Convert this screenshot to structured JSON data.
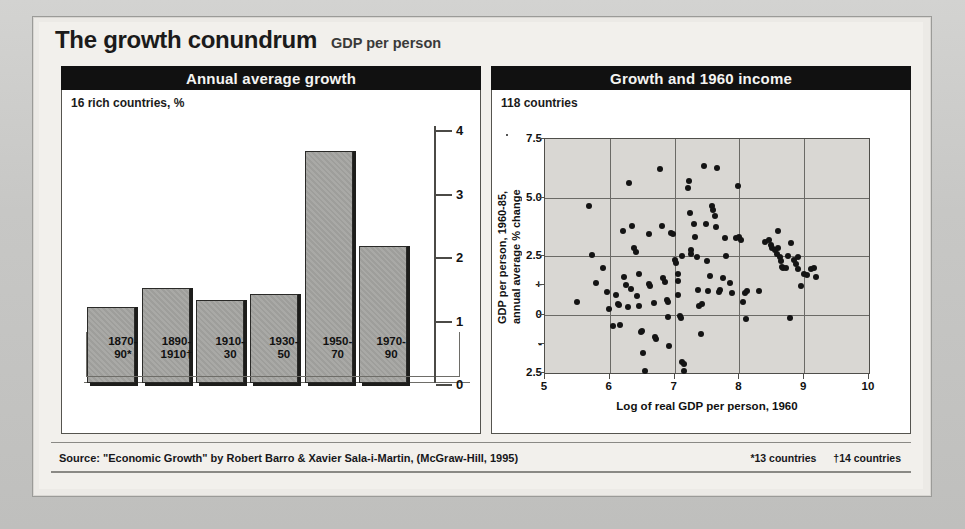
{
  "header": {
    "title": "The growth conundrum",
    "subtitle": "GDP per person"
  },
  "panels": {
    "left": {
      "heading": "Annual average growth",
      "note": "16 rich countries, %"
    },
    "right": {
      "heading": "Growth and 1960 income",
      "note": "118 countries"
    }
  },
  "footer": {
    "source": "Source: \"Economic Growth\" by Robert Barro & Xavier Sala-i-Martin, (McGraw-Hill, 1995)",
    "note_star": "*13 countries",
    "note_dagger": "†14 countries"
  },
  "chart_data": [
    {
      "type": "bar",
      "title": "Annual average growth",
      "subtitle": "16 rich countries, %",
      "xlabel": "",
      "ylabel": "%",
      "ylim": [
        0,
        4
      ],
      "yticks": [
        0,
        1,
        2,
        3,
        4
      ],
      "ytick_labels": [
        "0",
        "1",
        "2",
        "3",
        "4"
      ],
      "grid": false,
      "axis_position": "right",
      "categories": [
        "1870-\n90*",
        "1890-\n1910†",
        "1910-\n30",
        "1930-\n50",
        "1950-\n70",
        "1970-\n90"
      ],
      "category_labels": [
        [
          "1870-",
          "90*"
        ],
        [
          "1890-",
          "1910†"
        ],
        [
          "1910-",
          "30"
        ],
        [
          "1930-",
          "50"
        ],
        [
          "1950-",
          "70"
        ],
        [
          "1970-",
          "90"
        ]
      ],
      "values": [
        1.2,
        1.5,
        1.3,
        1.4,
        3.65,
        2.15
      ]
    },
    {
      "type": "scatter",
      "title": "Growth and 1960 income",
      "subtitle": "118 countries",
      "xlabel": "Log of real GDP per person, 1960",
      "ylabel": "GDP per person, 1960-85,\nannual average % change",
      "xlim": [
        5,
        10
      ],
      "ylim": [
        -2.5,
        7.5
      ],
      "xticks": [
        5,
        6,
        7,
        8,
        9,
        10
      ],
      "xtick_labels": [
        "5",
        "6",
        "7",
        "8",
        "9",
        "10"
      ],
      "yticks": [
        7.5,
        5.0,
        2.5,
        1.25,
        0,
        -1.25,
        -2.5
      ],
      "ytick_labels": [
        "7.5",
        "5.0",
        "2.5",
        "+",
        "0",
        "-",
        "2.5"
      ],
      "grid": true,
      "points": [
        [
          5.5,
          0.55
        ],
        [
          5.68,
          4.62
        ],
        [
          5.72,
          2.53
        ],
        [
          5.78,
          1.35
        ],
        [
          5.9,
          2.0
        ],
        [
          5.95,
          0.95
        ],
        [
          5.98,
          0.25
        ],
        [
          6.1,
          0.85
        ],
        [
          6.12,
          0.45
        ],
        [
          6.14,
          0.4
        ],
        [
          6.15,
          -0.45
        ],
        [
          6.2,
          3.55
        ],
        [
          6.22,
          1.6
        ],
        [
          6.25,
          1.25
        ],
        [
          6.3,
          5.6
        ],
        [
          6.32,
          1.1
        ],
        [
          6.35,
          3.8
        ],
        [
          6.38,
          2.85
        ],
        [
          6.4,
          2.65
        ],
        [
          6.42,
          0.8
        ],
        [
          6.45,
          0.35
        ],
        [
          6.48,
          -0.75
        ],
        [
          6.5,
          -0.7
        ],
        [
          6.52,
          -1.65
        ],
        [
          6.55,
          -2.4
        ],
        [
          6.6,
          3.45
        ],
        [
          6.62,
          1.2
        ],
        [
          6.68,
          0.5
        ],
        [
          6.7,
          -0.95
        ],
        [
          6.72,
          -1.05
        ],
        [
          6.78,
          6.2
        ],
        [
          6.8,
          3.8
        ],
        [
          6.82,
          1.55
        ],
        [
          6.85,
          1.4
        ],
        [
          6.88,
          0.6
        ],
        [
          6.9,
          -0.1
        ],
        [
          6.92,
          -1.35
        ],
        [
          6.95,
          3.5
        ],
        [
          6.98,
          3.45
        ],
        [
          7.0,
          2.35
        ],
        [
          7.02,
          2.2
        ],
        [
          7.05,
          1.45
        ],
        [
          7.06,
          0.85
        ],
        [
          7.08,
          -0.05
        ],
        [
          7.1,
          -0.15
        ],
        [
          7.12,
          -2.05
        ],
        [
          7.14,
          -2.1
        ],
        [
          7.15,
          -2.4
        ],
        [
          7.2,
          5.4
        ],
        [
          7.22,
          5.7
        ],
        [
          7.24,
          4.35
        ],
        [
          7.25,
          2.75
        ],
        [
          7.26,
          2.6
        ],
        [
          7.3,
          3.85
        ],
        [
          7.32,
          3.3
        ],
        [
          7.34,
          2.45
        ],
        [
          7.36,
          1.05
        ],
        [
          7.38,
          0.35
        ],
        [
          7.4,
          -0.85
        ],
        [
          7.45,
          6.35
        ],
        [
          7.48,
          3.85
        ],
        [
          7.5,
          2.3
        ],
        [
          7.52,
          1.0
        ],
        [
          7.55,
          1.65
        ],
        [
          7.58,
          4.65
        ],
        [
          7.6,
          4.45
        ],
        [
          7.62,
          4.2
        ],
        [
          7.64,
          3.75
        ],
        [
          7.66,
          6.25
        ],
        [
          7.7,
          1.05
        ],
        [
          7.75,
          1.55
        ],
        [
          7.8,
          2.5
        ],
        [
          7.85,
          1.35
        ],
        [
          7.88,
          0.9
        ],
        [
          7.95,
          3.25
        ],
        [
          7.98,
          5.5
        ],
        [
          8.0,
          3.3
        ],
        [
          8.02,
          3.2
        ],
        [
          8.05,
          0.55
        ],
        [
          8.08,
          0.9
        ],
        [
          8.1,
          -0.2
        ],
        [
          8.4,
          3.1
        ],
        [
          8.45,
          3.2
        ],
        [
          8.48,
          2.95
        ],
        [
          8.5,
          2.85
        ],
        [
          8.55,
          2.75
        ],
        [
          8.58,
          2.6
        ],
        [
          8.6,
          3.55
        ],
        [
          8.62,
          2.45
        ],
        [
          8.64,
          2.3
        ],
        [
          8.66,
          2.05
        ],
        [
          8.68,
          2.0
        ],
        [
          8.72,
          2.0
        ],
        [
          8.75,
          2.5
        ],
        [
          8.78,
          -0.15
        ],
        [
          8.8,
          3.05
        ],
        [
          8.85,
          2.35
        ],
        [
          8.88,
          2.15
        ],
        [
          8.9,
          1.95
        ],
        [
          8.95,
          1.2
        ],
        [
          9.0,
          1.75
        ],
        [
          9.05,
          1.7
        ],
        [
          9.1,
          1.95
        ],
        [
          9.15,
          2.0
        ],
        [
          9.18,
          1.6
        ],
        [
          6.05,
          -0.5
        ],
        [
          6.6,
          1.3
        ],
        [
          7.05,
          1.75
        ],
        [
          7.78,
          3.25
        ],
        [
          8.3,
          1.0
        ],
        [
          6.45,
          1.75
        ],
        [
          6.9,
          0.55
        ],
        [
          7.42,
          0.45
        ],
        [
          7.68,
          0.95
        ],
        [
          8.12,
          1.0
        ],
        [
          6.28,
          0.3
        ],
        [
          7.12,
          2.5
        ],
        [
          8.6,
          2.85
        ],
        [
          8.9,
          2.45
        ]
      ]
    }
  ]
}
